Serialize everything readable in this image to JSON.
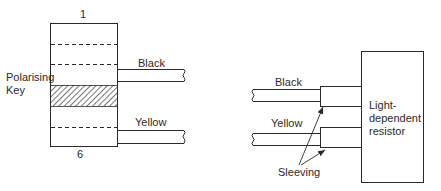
{
  "diagram": {
    "left": {
      "connector": {
        "pin_top_label": "1",
        "pin_bottom_label": "6",
        "key_label_line1": "Polarising",
        "key_label_line2": "Key"
      },
      "wires": [
        {
          "label": "Black"
        },
        {
          "label": "Yellow"
        }
      ]
    },
    "right": {
      "component_label_line1": "Light-",
      "component_label_line2": "dependent",
      "component_label_line3": "resistor",
      "wires": [
        {
          "label": "Black"
        },
        {
          "label": "Yellow"
        }
      ],
      "sleeving_label": "Sleeving"
    },
    "colors": {
      "line": "#2a2a2a",
      "background": "#ffffff"
    }
  }
}
